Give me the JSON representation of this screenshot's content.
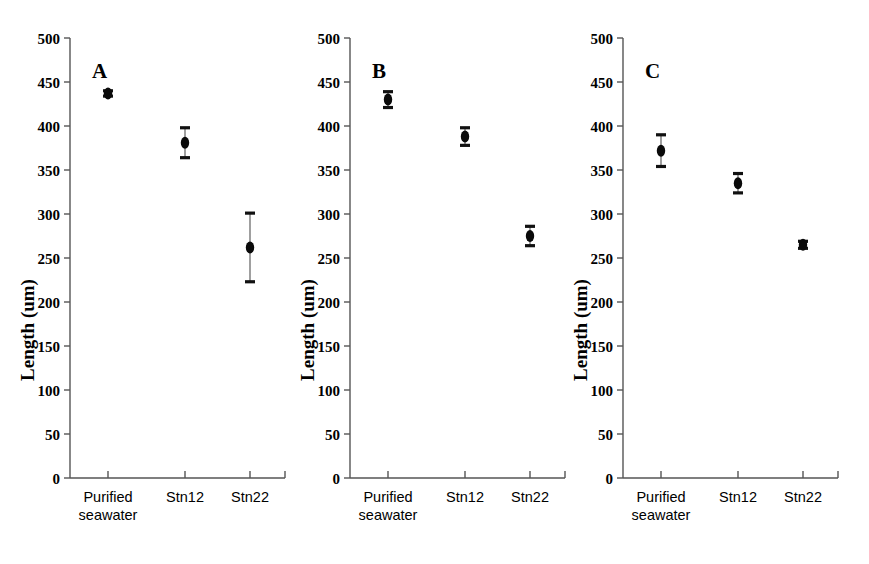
{
  "figure": {
    "background_color": "#ffffff",
    "marker_color": "#0a0a0a",
    "axis_color": "#555555",
    "errorbar_color": "#888888"
  },
  "axis": {
    "y_title": "Length (um)",
    "y_ticks": [
      "500",
      "450",
      "400",
      "350",
      "300",
      "250",
      "200",
      "150",
      "100",
      "50",
      "0"
    ],
    "x_categories": [
      "Purified seawater",
      "Stn12",
      "Stn22"
    ],
    "x_category_line1": [
      "Purified",
      "Stn12",
      "Stn22"
    ],
    "x_category_line2": [
      "seawater",
      "",
      ""
    ]
  },
  "panels": [
    {
      "letter": "A"
    },
    {
      "letter": "B"
    },
    {
      "letter": "C"
    }
  ],
  "chart_data": [
    {
      "type": "scatter",
      "title": "A",
      "xlabel": "",
      "ylabel": "Length (um)",
      "ylim": [
        0,
        500
      ],
      "yticks": [
        0,
        50,
        100,
        150,
        200,
        250,
        300,
        350,
        400,
        450,
        500
      ],
      "grid": false,
      "legend": "none",
      "categories": [
        "Purified seawater",
        "Stn12",
        "Stn22"
      ],
      "values": [
        437,
        381,
        262
      ],
      "errors": [
        3,
        17,
        39
      ]
    },
    {
      "type": "scatter",
      "title": "B",
      "xlabel": "",
      "ylabel": "Length (um)",
      "ylim": [
        0,
        500
      ],
      "yticks": [
        0,
        50,
        100,
        150,
        200,
        250,
        300,
        350,
        400,
        450,
        500
      ],
      "grid": false,
      "legend": "none",
      "categories": [
        "Purified seawater",
        "Stn12",
        "Stn22"
      ],
      "values": [
        430,
        388,
        275
      ],
      "errors": [
        9,
        10,
        11
      ]
    },
    {
      "type": "scatter",
      "title": "C",
      "xlabel": "",
      "ylabel": "Length (um)",
      "ylim": [
        0,
        500
      ],
      "yticks": [
        0,
        50,
        100,
        150,
        200,
        250,
        300,
        350,
        400,
        450,
        500
      ],
      "grid": false,
      "legend": "none",
      "categories": [
        "Purified seawater",
        "Stn12",
        "Stn22"
      ],
      "values": [
        372,
        335,
        265
      ],
      "errors": [
        18,
        11,
        4
      ]
    }
  ]
}
